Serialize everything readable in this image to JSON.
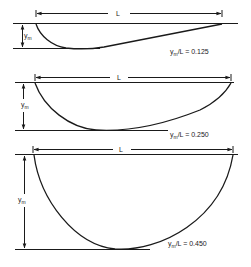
{
  "diagrams": [
    {
      "length_label": "L",
      "depth_label": "y",
      "depth_sub": "m",
      "ratio_prefix": "y",
      "ratio_sub": "m",
      "ratio_text": "/L = 0.125",
      "ratio": 0.125
    },
    {
      "length_label": "L",
      "depth_label": "y",
      "depth_sub": "m",
      "ratio_prefix": "y",
      "ratio_sub": "m",
      "ratio_text": "/L = 0.250",
      "ratio": 0.25
    },
    {
      "length_label": "L",
      "depth_label": "y",
      "depth_sub": "m",
      "ratio_prefix": "y",
      "ratio_sub": "m",
      "ratio_text": "/L = 0.450",
      "ratio": 0.45
    }
  ],
  "colors": {
    "line": "#1a1a1a",
    "background": "#ffffff"
  }
}
